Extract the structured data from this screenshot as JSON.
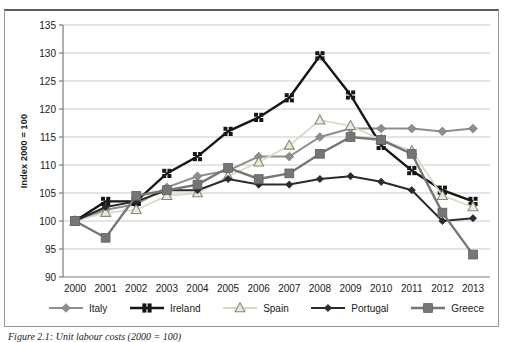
{
  "figure": {
    "caption": "Figure 2.1: Unit labour costs (2000 = 100)"
  },
  "chart_data": {
    "type": "line",
    "title": "",
    "xlabel": "",
    "ylabel": "Index 2000 = 100",
    "ylim": [
      90,
      135
    ],
    "ytick_step": 5,
    "grid": true,
    "legend_position": "bottom",
    "background": "#ffffff",
    "grid_color": "#c9c9c9",
    "axis_color": "#7a7a7a",
    "x": [
      "2000",
      "2001",
      "2002",
      "2003",
      "2004",
      "2005",
      "2006",
      "2007",
      "2008",
      "2009",
      "2010",
      "2011",
      "2012",
      "2013"
    ],
    "series": [
      {
        "name": "Italy",
        "marker": "diamond",
        "color": "#8e8e8e",
        "fill": "#8e8e8e",
        "stroke": "#7a7a7a",
        "line_width": 2,
        "marker_size": 4.3,
        "values": [
          100,
          102,
          103,
          106,
          108,
          109,
          111.5,
          111.5,
          115,
          116.5,
          116.5,
          116.5,
          116,
          116.5
        ]
      },
      {
        "name": "Ireland",
        "marker": "squares4",
        "color": "#161616",
        "fill": "#161616",
        "stroke": "#161616",
        "line_width": 2.4,
        "marker_size": 4,
        "values": [
          100,
          103.5,
          103.5,
          108.5,
          111.5,
          116,
          118.5,
          122,
          129.5,
          122.5,
          113.5,
          109,
          105.5,
          103.5
        ]
      },
      {
        "name": "Spain",
        "marker": "triangle",
        "color": "#d9d9c8",
        "fill": "#eaeadb",
        "stroke": "#88887b",
        "line_width": 1.8,
        "marker_size": 5.2,
        "values": [
          100,
          101.5,
          102,
          104.5,
          105,
          108,
          110.5,
          113.5,
          118,
          117,
          114.5,
          112.5,
          104.5,
          102.5
        ]
      },
      {
        "name": "Portugal",
        "marker": "diamond",
        "color": "#2b2b2b",
        "fill": "#2b2b2b",
        "stroke": "#2b2b2b",
        "line_width": 2,
        "marker_size": 3.6,
        "values": [
          100,
          102.5,
          103.5,
          105.5,
          105.5,
          107.5,
          106.5,
          106.5,
          107.5,
          108,
          107,
          105.5,
          100,
          100.5
        ]
      },
      {
        "name": "Greece",
        "marker": "square",
        "color": "#767676",
        "fill": "#767676",
        "stroke": "#616161",
        "line_width": 2.4,
        "marker_size": 4.4,
        "values": [
          100,
          97,
          104.5,
          105.5,
          106.5,
          109.5,
          107.5,
          108.5,
          112,
          115,
          114.5,
          112,
          101.5,
          94
        ]
      }
    ]
  }
}
